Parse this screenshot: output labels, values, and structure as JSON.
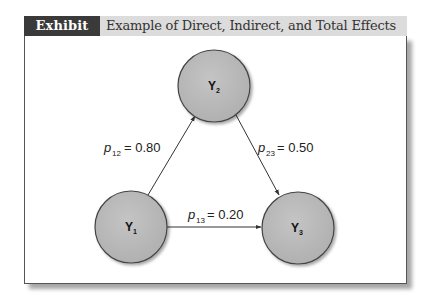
{
  "header": {
    "tag": "Exhibit 6.4",
    "title": "Example of Direct, Indirect, and Total Effects"
  },
  "colors": {
    "tag_bg": "#3a3a3a",
    "header_bg": "#dcdcdc",
    "node_fill": "#b8b8b8",
    "node_stroke": "#444444"
  },
  "nodes": [
    {
      "id": "Y2",
      "label": "Y",
      "sub": "2"
    },
    {
      "id": "Y1",
      "label": "Y",
      "sub": "1"
    },
    {
      "id": "Y3",
      "label": "Y",
      "sub": "3"
    }
  ],
  "edges": [
    {
      "from": "Y1",
      "to": "Y2",
      "p": "p",
      "sub": "12",
      "eq": "= 0.80"
    },
    {
      "from": "Y2",
      "to": "Y3",
      "p": "p",
      "sub": "23",
      "eq": "= 0.50"
    },
    {
      "from": "Y1",
      "to": "Y3",
      "p": "p",
      "sub": "13",
      "eq": "= 0.20"
    }
  ]
}
